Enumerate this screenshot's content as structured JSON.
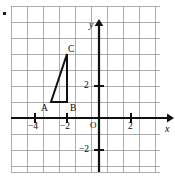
{
  "figure": {
    "type": "coordinate-grid-diagram",
    "corner_mark": "•"
  },
  "axes": {
    "x_label": "x",
    "y_label": "y",
    "origin_label": "O",
    "x_ticks": [
      {
        "value": -4,
        "label": "−4"
      },
      {
        "value": -2,
        "label": "−2"
      },
      {
        "value": 2,
        "label": "2"
      }
    ],
    "y_ticks": [
      {
        "value": 2,
        "label": "2"
      },
      {
        "value": -2,
        "label": "−2"
      }
    ],
    "xlim": [
      -5.3,
      4.0
    ],
    "ylim": [
      -3.3,
      6.0
    ],
    "grid": true,
    "grid_color": "#9a9a9a",
    "axis_color": "#111111"
  },
  "shape": {
    "name": "triangle-ABC",
    "color": "#111111",
    "vertices": [
      {
        "name": "A",
        "label": "A",
        "x": -3,
        "y": 1,
        "label_dx": -10,
        "label_dy": 10
      },
      {
        "name": "B",
        "label": "B",
        "x": -2,
        "y": 1,
        "label_dx": 4,
        "label_dy": 10
      },
      {
        "name": "C",
        "label": "C",
        "x": -2,
        "y": 4,
        "label_dx": 3,
        "label_dy": -3
      }
    ]
  },
  "chart_data": {
    "type": "scatter",
    "title": "",
    "xlabel": "x",
    "ylabel": "y",
    "xlim": [
      -5.3,
      4.0
    ],
    "ylim": [
      -3.3,
      6.0
    ],
    "grid": true,
    "xticks": [
      -4,
      -2,
      2
    ],
    "yticks": [
      2,
      -2
    ],
    "xticklabels": [
      "−4",
      "−2",
      "2"
    ],
    "yticklabels": [
      "2",
      "−2"
    ],
    "annotations": [
      {
        "text": "A",
        "x": -3,
        "y": 1
      },
      {
        "text": "B",
        "x": -2,
        "y": 1
      },
      {
        "text": "C",
        "x": -2,
        "y": 4
      },
      {
        "text": "O",
        "x": 0,
        "y": 0
      }
    ],
    "series": [
      {
        "name": "triangle ABC",
        "type": "polygon",
        "closed": true,
        "x": [
          -3,
          -2,
          -2
        ],
        "y": [
          1,
          1,
          4
        ]
      }
    ]
  }
}
